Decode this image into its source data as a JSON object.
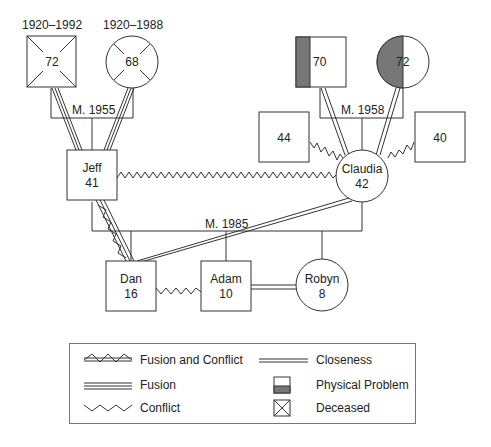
{
  "diagram_type": "genogram",
  "grandparents_paternal": {
    "father": {
      "age": "72",
      "dates": "1920–1992",
      "sex": "male",
      "status": "deceased"
    },
    "mother": {
      "age": "68",
      "dates": "1920–1988",
      "sex": "female",
      "status": "deceased"
    },
    "marriage": "M. 1955"
  },
  "grandparents_maternal": {
    "father": {
      "age": "70",
      "sex": "male",
      "status": "physical-problem"
    },
    "mother": {
      "age": "72",
      "sex": "female",
      "status": "physical-problem"
    },
    "marriage": "M. 1958"
  },
  "siblings_of_claudia": [
    {
      "age": "44",
      "sex": "male"
    },
    {
      "age": "40",
      "sex": "male"
    }
  ],
  "parents": {
    "father": {
      "name": "Jeff",
      "age": "41",
      "sex": "male"
    },
    "mother": {
      "name": "Claudia",
      "age": "42",
      "sex": "female"
    },
    "marriage": "M. 1985"
  },
  "children": [
    {
      "name": "Dan",
      "age": "16",
      "sex": "male"
    },
    {
      "name": "Adam",
      "age": "10",
      "sex": "male"
    },
    {
      "name": "Robyn",
      "age": "8",
      "sex": "female"
    }
  ],
  "relationships": [
    {
      "from": "Paternal grandfather",
      "to": "Jeff",
      "type": "Fusion"
    },
    {
      "from": "Paternal grandmother",
      "to": "Jeff",
      "type": "Fusion"
    },
    {
      "from": "Maternal grandfather",
      "to": "Claudia",
      "type": "Closeness"
    },
    {
      "from": "Maternal grandmother",
      "to": "Claudia",
      "type": "Closeness"
    },
    {
      "from": "Sibling 44",
      "to": "Claudia",
      "type": "Conflict"
    },
    {
      "from": "Sibling 40",
      "to": "Claudia",
      "type": "Conflict"
    },
    {
      "from": "Jeff",
      "to": "Claudia",
      "type": "Conflict"
    },
    {
      "from": "Jeff",
      "to": "Dan",
      "type": "Fusion and Conflict"
    },
    {
      "from": "Claudia",
      "to": "Dan",
      "type": "Closeness"
    },
    {
      "from": "Dan",
      "to": "Adam",
      "type": "Conflict"
    },
    {
      "from": "Adam",
      "to": "Robyn",
      "type": "Closeness"
    }
  ],
  "legend": {
    "items": [
      {
        "label": "Fusion and Conflict",
        "icon": "fusion-conflict-line-icon"
      },
      {
        "label": "Closeness",
        "icon": "double-line-icon"
      },
      {
        "label": "Fusion",
        "icon": "triple-line-icon"
      },
      {
        "label": "Physical Problem",
        "icon": "half-shaded-square-icon"
      },
      {
        "label": "Conflict",
        "icon": "zigzag-line-icon"
      },
      {
        "label": "Deceased",
        "icon": "crossed-square-icon"
      }
    ]
  },
  "colors": {
    "line": "#333333",
    "shade": "#777777",
    "background": "#ffffff"
  }
}
